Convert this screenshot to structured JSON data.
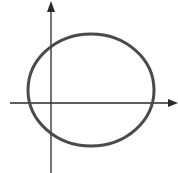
{
  "diagram": {
    "type": "closed-curve-on-axes",
    "colors": {
      "axes": "#2a2a2a",
      "curve": "#4a4a4a",
      "background": "#ffffff"
    },
    "axes": {
      "x_axis": {
        "y": 103,
        "x_start": 10,
        "x_end": 178,
        "arrow": "right"
      },
      "y_axis": {
        "x": 51,
        "y_start": 173,
        "y_end": 1,
        "arrow": "up"
      }
    },
    "curve": {
      "shape": "ellipse",
      "cx": 91,
      "cy": 90,
      "rx": 63,
      "ry": 56,
      "stroke_width": 3
    }
  }
}
